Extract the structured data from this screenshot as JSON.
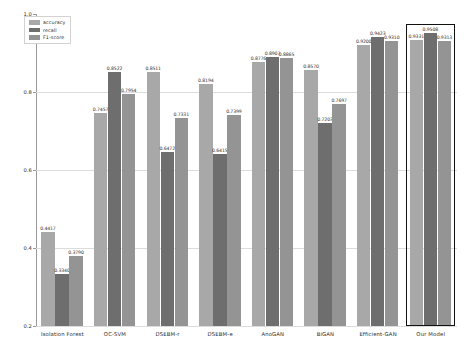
{
  "chart_data": {
    "type": "bar",
    "title": "",
    "xlabel": "",
    "ylabel": "",
    "ylim": [
      0.2,
      1.0
    ],
    "yticks": [
      "1.0",
      "0.8",
      "0.6",
      "0.4",
      "0.2"
    ],
    "ytick_values": [
      1.0,
      0.8,
      0.6,
      0.4,
      0.2
    ],
    "grid": true,
    "legend_position": "upper left",
    "categories": [
      "Isolation Forest",
      "OC-SVM",
      "DSEBM-r",
      "DSEBM-e",
      "AnoGAN",
      "BiGAN",
      "Efficient-GAN",
      "Our Model"
    ],
    "series": [
      {
        "name": "accuracy",
        "color": "#a8a8a8",
        "values": [
          0.4417,
          0.7457,
          0.8511,
          0.8194,
          0.8776,
          0.857,
          0.92,
          0.9331
        ],
        "labels": [
          "0.4417",
          "0.7457",
          "0.8511",
          "0.8194",
          "0.8776",
          "0.8570",
          "0.9200",
          "0.9331"
        ]
      },
      {
        "name": "recall",
        "color": "#6e6e6e",
        "values": [
          0.334,
          0.8522,
          0.6472,
          0.6415,
          0.8907,
          0.7203,
          0.9423,
          0.9508
        ],
        "labels": [
          "0.3340",
          "0.8522",
          "0.6472",
          "0.6415",
          "0.8907",
          "0.7203",
          "0.9423",
          "0.9508"
        ]
      },
      {
        "name": "F1-score",
        "color": "#949494",
        "values": [
          0.379,
          0.7954,
          0.7331,
          0.7399,
          0.8865,
          0.7697,
          0.931,
          0.9313
        ],
        "labels": [
          "0.3790",
          "0.7954",
          "0.7331",
          "0.7399",
          "0.8865",
          "0.7697",
          "0.9310",
          "0.9313"
        ]
      }
    ],
    "highlighted_category": "Our Model"
  },
  "legend": {
    "items": [
      {
        "label": "accuracy"
      },
      {
        "label": "recall"
      },
      {
        "label": "F1-score"
      }
    ]
  }
}
